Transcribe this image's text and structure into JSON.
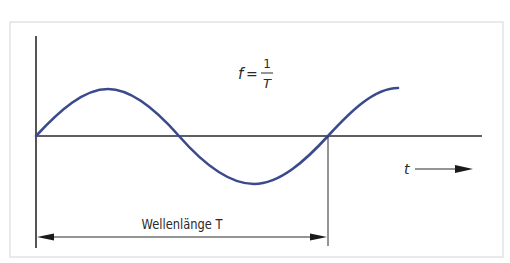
{
  "diagram": {
    "formula": {
      "lhs": "f",
      "equals": "=",
      "numerator": "1",
      "denominator": "T"
    },
    "time_axis_label": "t",
    "wavelength_label": "Wellenlänge T",
    "colors": {
      "wave": "#3a4a8c",
      "axes": "#2a2a2a",
      "frame": "#e3e3e3"
    }
  }
}
